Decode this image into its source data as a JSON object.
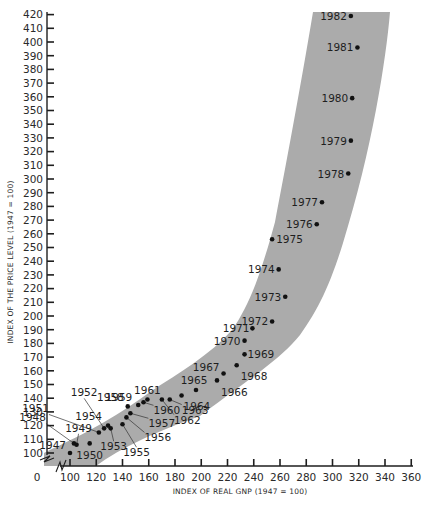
{
  "chart_data": {
    "type": "scatter",
    "title": "",
    "xlabel": "INDEX OF REAL GNP (1947 = 100)",
    "ylabel": "INDEX OF THE PRICE LEVEL (1947 = 100)",
    "xlim": [
      0,
      360
    ],
    "ylim": [
      100,
      420
    ],
    "x_ticks": [
      0,
      100,
      120,
      140,
      160,
      180,
      200,
      220,
      240,
      260,
      280,
      300,
      320,
      340,
      360
    ],
    "y_ticks": [
      100,
      110,
      120,
      130,
      140,
      150,
      160,
      170,
      180,
      190,
      200,
      210,
      220,
      230,
      240,
      250,
      260,
      270,
      280,
      290,
      300,
      310,
      320,
      330,
      340,
      350,
      360,
      370,
      380,
      390,
      400,
      410,
      420
    ],
    "axis_breaks": [
      "x",
      "y"
    ],
    "grid": false,
    "legend": null,
    "annotations": "Shaded band showing the trend of price level vs real GNP; each dot labeled with year",
    "band_color": "#ababab",
    "point_color": "#111111",
    "points": [
      {
        "label": "1947",
        "x": 100,
        "y": 100
      },
      {
        "label": "1948",
        "x": 103,
        "y": 107
      },
      {
        "label": "1949",
        "x": 105,
        "y": 106
      },
      {
        "label": "1950",
        "x": 115,
        "y": 107
      },
      {
        "label": "1951",
        "x": 122,
        "y": 115
      },
      {
        "label": "1952",
        "x": 126,
        "y": 118
      },
      {
        "label": "1953",
        "x": 131,
        "y": 118
      },
      {
        "label": "1954",
        "x": 129,
        "y": 120
      },
      {
        "label": "1955",
        "x": 140,
        "y": 121
      },
      {
        "label": "1956",
        "x": 143,
        "y": 126
      },
      {
        "label": "1957",
        "x": 146,
        "y": 129
      },
      {
        "label": "1958",
        "x": 144,
        "y": 134
      },
      {
        "label": "1959",
        "x": 152,
        "y": 135
      },
      {
        "label": "1960",
        "x": 156,
        "y": 137
      },
      {
        "label": "1961",
        "x": 159,
        "y": 139
      },
      {
        "label": "1962",
        "x": 170,
        "y": 139
      },
      {
        "label": "1963",
        "x": 176,
        "y": 139
      },
      {
        "label": "1964",
        "x": 185,
        "y": 142
      },
      {
        "label": "1965",
        "x": 196,
        "y": 146
      },
      {
        "label": "1966",
        "x": 212,
        "y": 153
      },
      {
        "label": "1967",
        "x": 217,
        "y": 158
      },
      {
        "label": "1968",
        "x": 227,
        "y": 164
      },
      {
        "label": "1969",
        "x": 233,
        "y": 172
      },
      {
        "label": "1970",
        "x": 233,
        "y": 182
      },
      {
        "label": "1971",
        "x": 239,
        "y": 191
      },
      {
        "label": "1972",
        "x": 254,
        "y": 196
      },
      {
        "label": "1973",
        "x": 264,
        "y": 214
      },
      {
        "label": "1974",
        "x": 259,
        "y": 234
      },
      {
        "label": "1975",
        "x": 254,
        "y": 256
      },
      {
        "label": "1976",
        "x": 288,
        "y": 267
      },
      {
        "label": "1977",
        "x": 292,
        "y": 283
      },
      {
        "label": "1978",
        "x": 312,
        "y": 304
      },
      {
        "label": "1979",
        "x": 314,
        "y": 328
      },
      {
        "label": "1980",
        "x": 315,
        "y": 359
      },
      {
        "label": "1981",
        "x": 319,
        "y": 396
      },
      {
        "label": "1982",
        "x": 314,
        "y": 419
      }
    ]
  }
}
